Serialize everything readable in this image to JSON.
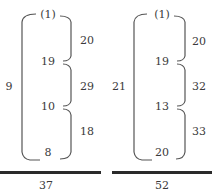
{
  "diagrams": [
    {
      "side_label": "9",
      "nodes": [
        "(1)",
        "19",
        "10",
        "8"
      ],
      "braces": [
        "20",
        "29",
        "18"
      ],
      "total": "37"
    },
    {
      "side_label": "21",
      "nodes": [
        "(1)",
        "19",
        "13",
        "20"
      ],
      "braces": [
        "20",
        "32",
        "33"
      ],
      "total": "52"
    }
  ],
  "colors": {
    "stroke": "#555555",
    "text": "#3a3a3a",
    "total_line": "#2a2a2a"
  }
}
